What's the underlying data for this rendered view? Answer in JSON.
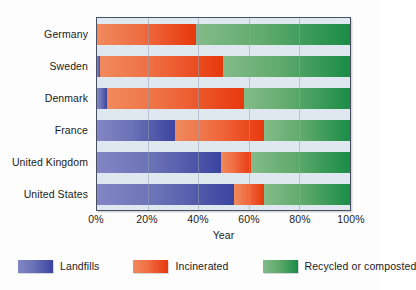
{
  "chart_data": {
    "type": "bar",
    "orientation": "horizontal",
    "stacked": true,
    "stack_total": 100,
    "title": "",
    "xlabel": "Year",
    "ylabel": "",
    "xlim": [
      0,
      100
    ],
    "xticks": [
      "0%",
      "20%",
      "40%",
      "60%",
      "80%",
      "100%"
    ],
    "xtick_values": [
      0,
      20,
      40,
      60,
      80,
      100
    ],
    "grid": true,
    "grid_axis": "x",
    "legend_position": "bottom",
    "categories": [
      "Germany",
      "Sweden",
      "Denmark",
      "France",
      "United Kingdom",
      "United States"
    ],
    "series": [
      {
        "name": "Landfills",
        "color": "#3b44a0",
        "values": [
          0,
          1,
          4,
          31,
          49,
          54
        ]
      },
      {
        "name": "Incinerated",
        "color": "#e8380d",
        "values": [
          39,
          49,
          54,
          35,
          12,
          12
        ]
      },
      {
        "name": "Recycled or composted",
        "color": "#1a8c46",
        "values": [
          61,
          50,
          42,
          34,
          39,
          34
        ]
      }
    ]
  },
  "legend": {
    "items": [
      {
        "label": "Landfills"
      },
      {
        "label": "Incinerated"
      },
      {
        "label": "Recycled or composted"
      }
    ]
  },
  "axis": {
    "x_title": "Year"
  },
  "colors": {
    "landfills": "#3b44a0",
    "incinerated": "#e8380d",
    "recycled": "#1a8c46",
    "plot_background": "#dfe7ef",
    "plot_border": "#4b4f63",
    "figure_background": "#fdfdfd",
    "text": "#1b1b1b"
  }
}
